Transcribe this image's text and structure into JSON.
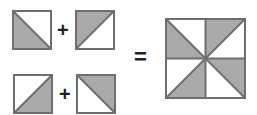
{
  "colors": {
    "fill": "#aaaaaa",
    "stroke": "#6e6e6e",
    "background": "#ffffff"
  },
  "equation": {
    "plus": "+",
    "equals": "=",
    "tiles": [
      {
        "id": "tile-1",
        "shaded": "bottom-left",
        "diagonal": "tl-br"
      },
      {
        "id": "tile-2",
        "shaded": "top-left",
        "diagonal": "bl-tr"
      },
      {
        "id": "tile-3",
        "shaded": "bottom-right",
        "diagonal": "bl-tr"
      },
      {
        "id": "tile-4",
        "shaded": "top-right",
        "diagonal": "tl-br"
      }
    ],
    "result": {
      "description": "pinwheel pattern of 4 tiles"
    }
  }
}
